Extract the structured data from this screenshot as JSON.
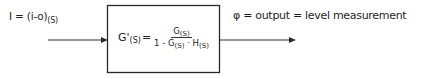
{
  "diagram": {
    "type": "block-diagram",
    "input": {
      "lhs": "I",
      "eq": " = ",
      "expr": "(i-o)",
      "subscript": "(S)"
    },
    "block": {
      "lhs": "G'",
      "lhs_subscript": "(S)",
      "eq": "=",
      "numerator": {
        "term": "G",
        "subscript": "(S)"
      },
      "denominator": {
        "prefix": "1 - G",
        "g_subscript": "(S)",
        "dot": " · H",
        "h_subscript": "(S)"
      }
    },
    "output": {
      "text": "φ = output = level measurement"
    },
    "colors": {
      "line": "#2a2a2a",
      "background": "#ffffff"
    }
  }
}
